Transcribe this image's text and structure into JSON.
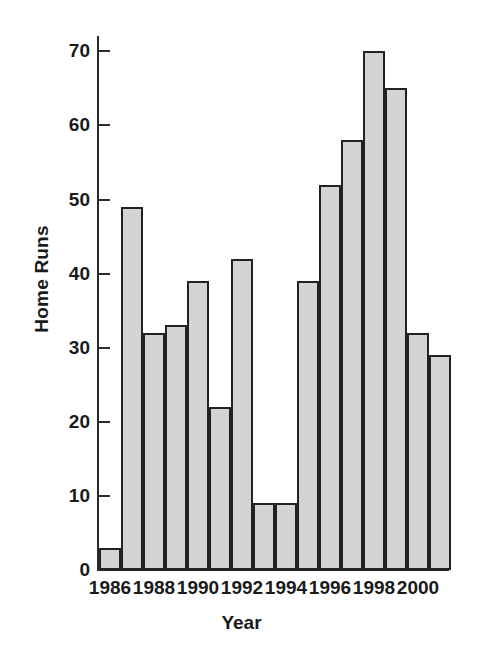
{
  "chart_data": {
    "type": "bar",
    "title": "",
    "xlabel": "Year",
    "ylabel": "Home Runs",
    "categories": [
      "1986",
      "1987",
      "1988",
      "1989",
      "1990",
      "1991",
      "1992",
      "1993",
      "1994",
      "1995",
      "1996",
      "1997",
      "1998",
      "1999",
      "2000",
      "2001"
    ],
    "values": [
      3,
      49,
      32,
      33,
      39,
      22,
      42,
      9,
      9,
      39,
      52,
      58,
      70,
      65,
      32,
      29
    ],
    "x_tick_labels": [
      "1986",
      "1988",
      "1990",
      "1992",
      "1994",
      "1996",
      "1998",
      "2000"
    ],
    "x_tick_categories": [
      "1986",
      "1988",
      "1990",
      "1992",
      "1994",
      "1996",
      "1998",
      "2000"
    ],
    "y_ticks": [
      0,
      10,
      20,
      30,
      40,
      50,
      60,
      70
    ],
    "y_tick_labels": [
      "0",
      "10",
      "20",
      "30",
      "40",
      "50",
      "60",
      "70"
    ],
    "ylim": [
      0,
      72
    ],
    "grid": false,
    "legend": null,
    "bar_fill_color": "#d4d4d4",
    "bar_edge_color": "#222222",
    "axis_color": "#2b2b2b",
    "background_color": "#ffffff"
  }
}
